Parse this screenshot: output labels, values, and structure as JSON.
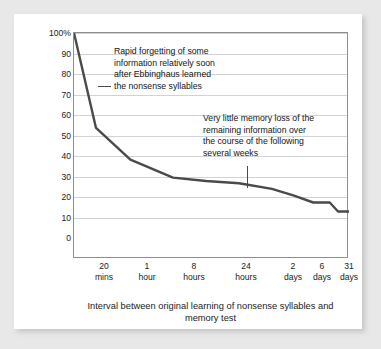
{
  "chart_data": {
    "type": "line",
    "title": "",
    "xlabel": "Interval between original learning\nof nonsense syllables and memory test",
    "ylabel": "Average percentage of information retained",
    "ylim": [
      0,
      100
    ],
    "grid": true,
    "legend": "none",
    "categories": [
      "0",
      "20 mins",
      "1 hour",
      "8 hours",
      "24 hours",
      "2 days",
      "6 days",
      "31 days"
    ],
    "x_tick_labels": [
      {
        "value": "20",
        "unit": "mins"
      },
      {
        "value": "1",
        "unit": "hour"
      },
      {
        "value": "8",
        "unit": "hours"
      },
      {
        "value": "24",
        "unit": "hours"
      },
      {
        "value": "2",
        "unit": "days"
      },
      {
        "value": "6",
        "unit": "days"
      },
      {
        "value": "31",
        "unit": "days"
      }
    ],
    "y_tick_labels": [
      "100%",
      "90",
      "80",
      "70",
      "60",
      "50",
      "40",
      "30",
      "20",
      "10",
      "0"
    ],
    "y_ticks": [
      100,
      90,
      80,
      70,
      60,
      50,
      40,
      30,
      20,
      10,
      0
    ],
    "values": [
      100,
      58,
      44,
      36,
      34,
      28,
      25,
      21
    ],
    "series": [
      {
        "name": "Percentage retained",
        "color": "#4a4a4a",
        "points": [
          {
            "x": 0,
            "y": 100
          },
          {
            "x": 8,
            "y": 58
          },
          {
            "x": 20.5,
            "y": 44
          },
          {
            "x": 36,
            "y": 36
          },
          {
            "x": 48,
            "y": 34.5
          },
          {
            "x": 60,
            "y": 33.5
          },
          {
            "x": 72,
            "y": 31
          },
          {
            "x": 80,
            "y": 28
          },
          {
            "x": 87,
            "y": 25
          },
          {
            "x": 93,
            "y": 25
          },
          {
            "x": 96,
            "y": 21
          },
          {
            "x": 100,
            "y": 21
          }
        ]
      }
    ],
    "annotations": [
      {
        "id": "rapid-forgetting",
        "text": "Rapid forgetting of some\ninformation relatively soon\nafter Ebbinghaus learned\nthe nonsense syllables"
      },
      {
        "id": "little-memory-loss",
        "text": "Very little memory loss of the\nremaining information over\nthe course of the following\nseveral weeks"
      }
    ]
  }
}
